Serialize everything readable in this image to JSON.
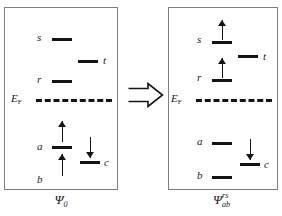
{
  "figure": {
    "type": "energy-level-diagram",
    "implies_icon": "double-right-arrow"
  },
  "fermi": {
    "label_main": "E",
    "label_sub": "F",
    "line_style": "dashed"
  },
  "panels": [
    {
      "id": "reference",
      "caption": {
        "psi": "Ψ",
        "sub": "0",
        "sup": ""
      },
      "levels": [
        {
          "name": "s",
          "label": "s",
          "label_side": "left",
          "occupancy": "empty",
          "arrows": []
        },
        {
          "name": "t",
          "label": "t",
          "label_side": "right",
          "occupancy": "empty",
          "arrows": []
        },
        {
          "name": "r",
          "label": "r",
          "label_side": "left",
          "occupancy": "empty",
          "arrows": []
        },
        {
          "name": "a",
          "label": "a",
          "label_side": "left",
          "occupancy": "occupied",
          "arrows": [
            "up"
          ]
        },
        {
          "name": "c",
          "label": "c",
          "label_side": "right",
          "occupancy": "occupied",
          "arrows": [
            "down"
          ]
        },
        {
          "name": "b",
          "label": "b",
          "label_side": "left",
          "occupancy": "occupied",
          "arrows": [
            "up"
          ]
        }
      ]
    },
    {
      "id": "double-excitation",
      "caption": {
        "psi": "Ψ",
        "sub": "ab",
        "sup": "rs"
      },
      "levels": [
        {
          "name": "s",
          "label": "s",
          "label_side": "left",
          "occupancy": "occupied",
          "arrows": [
            "up"
          ]
        },
        {
          "name": "t",
          "label": "t",
          "label_side": "right",
          "occupancy": "empty",
          "arrows": []
        },
        {
          "name": "r",
          "label": "r",
          "label_side": "left",
          "occupancy": "occupied",
          "arrows": [
            "up"
          ]
        },
        {
          "name": "a",
          "label": "a",
          "label_side": "left",
          "occupancy": "empty",
          "arrows": []
        },
        {
          "name": "c",
          "label": "c",
          "label_side": "right",
          "occupancy": "occupied",
          "arrows": [
            "down"
          ]
        },
        {
          "name": "b",
          "label": "b",
          "label_side": "left",
          "occupancy": "empty",
          "arrows": []
        }
      ]
    }
  ],
  "colors": {
    "ink": "#141414",
    "frame": "#7e7e7e",
    "background": "#ffffff"
  }
}
